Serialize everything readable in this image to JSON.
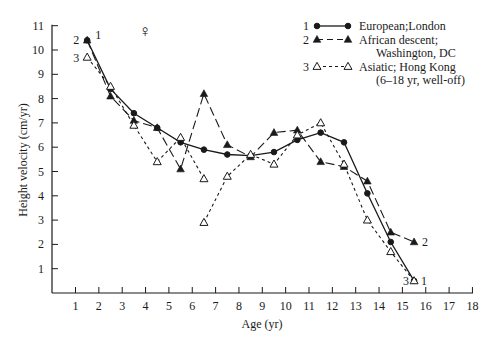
{
  "chart_data": {
    "type": "line",
    "title": "",
    "symbol": "♀",
    "xlabel": "Age (yr)",
    "ylabel": "Height velocity (cm/yr)",
    "xlim": [
      0.5,
      18
    ],
    "ylim": [
      0,
      11
    ],
    "xticks": [
      1,
      2,
      3,
      4,
      5,
      6,
      7,
      8,
      9,
      10,
      11,
      12,
      13,
      14,
      15,
      16,
      17,
      18
    ],
    "yticks": [
      1,
      2,
      3,
      4,
      5,
      6,
      7,
      8,
      9,
      10,
      11
    ],
    "grid": false,
    "legend_position": "top-right",
    "series": [
      {
        "id": "1",
        "name": "European;London",
        "marker": "filled-circle",
        "line": "solid",
        "segments": [
          {
            "x": [
              1.5,
              2.5,
              3.5,
              4.5,
              5.5,
              6.5,
              7.5,
              8.5,
              9.5,
              10.5,
              11.5,
              12.5,
              13.5,
              14.5,
              15.5
            ],
            "y": [
              10.4,
              8.4,
              7.4,
              6.8,
              6.2,
              5.9,
              5.7,
              5.65,
              5.8,
              6.3,
              6.6,
              6.2,
              4.1,
              2.1,
              0.5
            ]
          }
        ]
      },
      {
        "id": "2",
        "name": "African descent; Washington, DC",
        "marker": "filled-triangle",
        "line": "long-dash",
        "segments": [
          {
            "x": [
              1.5,
              2.5,
              3.5,
              4.5,
              5.5,
              6.5,
              7.5,
              8.5,
              9.5,
              10.5,
              11.5,
              12.5,
              13.5,
              14.5,
              15.5
            ],
            "y": [
              10.4,
              8.1,
              7.1,
              6.8,
              5.1,
              8.2,
              6.1,
              5.6,
              6.6,
              6.7,
              5.4,
              5.2,
              4.6,
              2.5,
              2.1
            ]
          }
        ]
      },
      {
        "id": "3",
        "name": "Asiatic; Hong Kong (6–18 yr, well-off)",
        "marker": "open-triangle",
        "line": "short-dash",
        "segments": [
          {
            "x": [
              1.5,
              2.5,
              3.5,
              4.5,
              5.5,
              6.5
            ],
            "y": [
              9.7,
              8.5,
              6.9,
              5.4,
              6.4,
              4.7
            ]
          },
          {
            "x": [
              6.5,
              7.5,
              8.5,
              9.5,
              10.5,
              11.5,
              12.5,
              13.5,
              14.5,
              15.5
            ],
            "y": [
              2.9,
              4.8,
              5.7,
              5.3,
              6.5,
              7.0,
              5.3,
              3.0,
              1.7,
              0.5
            ]
          }
        ]
      }
    ],
    "legend": [
      {
        "num": "1",
        "lines": [
          "European;London"
        ]
      },
      {
        "num": "2",
        "lines": [
          "African descent;",
          "Washington, DC"
        ]
      },
      {
        "num": "3",
        "lines": [
          "Asiatic;  Hong Kong",
          "(6–18 yr, well-off)"
        ]
      }
    ],
    "annotations": {
      "start_labels": [
        {
          "text": "2",
          "x": 1.5,
          "y": 10.4,
          "side": "left"
        },
        {
          "text": "1",
          "x": 1.5,
          "y": 10.4,
          "side": "right"
        },
        {
          "text": "3",
          "x": 1.5,
          "y": 9.7,
          "side": "left"
        }
      ],
      "end_labels": [
        {
          "text": "2",
          "x": 15.5,
          "y": 2.1,
          "side": "right"
        },
        {
          "text": "1",
          "x": 15.5,
          "y": 0.5,
          "side": "right"
        },
        {
          "text": "3",
          "x": 15.5,
          "y": 0.5,
          "side": "left"
        }
      ]
    },
    "colors": {
      "ink": "#1a1a1a",
      "background": "#ffffff"
    }
  }
}
